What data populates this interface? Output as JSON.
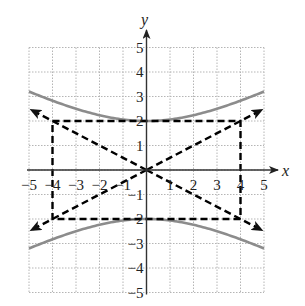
{
  "chart_data": {
    "type": "line",
    "title": "",
    "xlabel": "x",
    "ylabel": "y",
    "xlim": [
      -5,
      5
    ],
    "ylim": [
      -5,
      5
    ],
    "grid": true,
    "grid_style": "dotted",
    "x_ticks": [
      -5,
      -4,
      -3,
      -2,
      -1,
      1,
      2,
      3,
      4,
      5
    ],
    "y_ticks": [
      -5,
      -4,
      -3,
      -2,
      -1,
      1,
      2,
      3,
      4,
      5
    ],
    "x_tick_labels": [
      "−5",
      "−4",
      "−3",
      "−2",
      "−1",
      "1",
      "2",
      "3",
      "4",
      "5"
    ],
    "y_tick_labels": [
      "−5",
      "−4",
      "−3",
      "−2",
      "−1",
      "1",
      "2",
      "3",
      "4",
      "5"
    ],
    "series": [
      {
        "name": "hyperbola upper branch",
        "style": "solid",
        "color": "#8c8c8c",
        "equation": "y^2/4 - x^2/16 = 1, y > 0",
        "x": [
          -5,
          -4,
          -3,
          -2,
          -1,
          0,
          1,
          2,
          3,
          4,
          5
        ],
        "y": [
          3.2,
          2.83,
          2.5,
          2.24,
          2.06,
          2.0,
          2.06,
          2.24,
          2.5,
          2.83,
          3.2
        ]
      },
      {
        "name": "hyperbola lower branch",
        "style": "solid",
        "color": "#8c8c8c",
        "equation": "y^2/4 - x^2/16 = 1, y < 0",
        "x": [
          -5,
          -4,
          -3,
          -2,
          -1,
          0,
          1,
          2,
          3,
          4,
          5
        ],
        "y": [
          -3.2,
          -2.83,
          -2.5,
          -2.24,
          -2.06,
          -2.0,
          -2.06,
          -2.24,
          -2.5,
          -2.83,
          -3.2
        ]
      },
      {
        "name": "asymptote y = x/2",
        "style": "dashed",
        "color": "#000000",
        "x": [
          -4.9,
          4.9
        ],
        "y": [
          -2.45,
          2.45
        ]
      },
      {
        "name": "asymptote y = -x/2",
        "style": "dashed",
        "color": "#000000",
        "x": [
          -4.9,
          4.9
        ],
        "y": [
          2.45,
          -2.45
        ]
      },
      {
        "name": "central rectangle",
        "style": "dashed",
        "color": "#000000",
        "x": [
          -4,
          4,
          4,
          -4,
          -4
        ],
        "y": [
          2,
          2,
          -2,
          -2,
          2
        ]
      }
    ]
  },
  "axes": {
    "x_label": "x",
    "y_label": "y"
  }
}
